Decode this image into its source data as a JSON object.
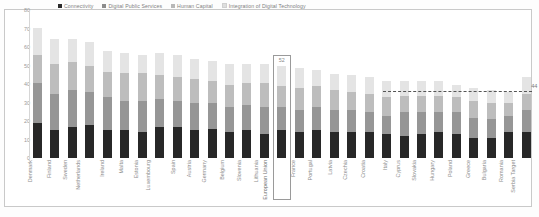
{
  "chart_data": {
    "type": "bar",
    "stacked": true,
    "title": "",
    "xlabel": "",
    "ylabel": "",
    "ylim": [
      0,
      80
    ],
    "yticks": [
      "80",
      "70",
      "60",
      "50",
      "40",
      "30",
      "20",
      "10",
      "0"
    ],
    "grid": false,
    "legend_position": "top",
    "series": [
      {
        "name": "Connectivity",
        "color": "#272727",
        "values": [
          19,
          15,
          17,
          18,
          15,
          15,
          14,
          17,
          17,
          15,
          16,
          14,
          15,
          13,
          15,
          14,
          15,
          14,
          14,
          14,
          13,
          12,
          13,
          14,
          13,
          11,
          11,
          14,
          14
        ]
      },
      {
        "name": "Human Capital",
        "color": "#969696",
        "values": [
          22,
          20,
          20,
          18,
          18,
          16,
          17,
          15,
          14,
          15,
          14,
          14,
          14,
          15,
          13,
          12,
          13,
          12,
          12,
          11,
          10,
          13,
          12,
          11,
          12,
          11,
          10,
          9,
          12
        ]
      },
      {
        "name": "Digital Public Services",
        "color": "#bdbdbd",
        "values": [
          15,
          16,
          15,
          14,
          14,
          15,
          15,
          13,
          13,
          13,
          12,
          12,
          12,
          13,
          11,
          12,
          11,
          11,
          10,
          10,
          10,
          9,
          9,
          9,
          8,
          9,
          9,
          7,
          9
        ]
      },
      {
        "name": "Integration of Digital Technology",
        "color": "#e4e4e4",
        "values": [
          15,
          14,
          13,
          13,
          11,
          11,
          10,
          12,
          12,
          11,
          11,
          11,
          10,
          10,
          11,
          11,
          9,
          9,
          9,
          9,
          9,
          8,
          8,
          8,
          7,
          7,
          7,
          6,
          9
        ]
      }
    ],
    "categories": [
      "Denmark",
      "Finland",
      "Sweden",
      "Netherlands",
      "Ireland",
      "Malta",
      "Estonia",
      "Luxembourg",
      "Spain",
      "Austria",
      "Germany",
      "Belgium",
      "Slovenia",
      "Lithuania",
      "European Union",
      "France",
      "Portugal",
      "Latvia",
      "Czechia",
      "Croatia",
      "Italy",
      "Cyprus",
      "Slovakia",
      "Hungary",
      "Poland",
      "Greece",
      "Bulgaria",
      "Romania",
      "Serbia Target"
    ],
    "highlighted_category": "European Union",
    "highlighted_value": "52",
    "annotations": [
      {
        "name": "target-line",
        "label": "44",
        "value": 44,
        "style": "dashed",
        "from_category": "Italy",
        "to_category": "Serbia Target"
      }
    ]
  },
  "legend": {
    "items": [
      {
        "label": "Connectivity",
        "swatch": "square-dark"
      },
      {
        "label": "Digital Public Services",
        "swatch": "square-mid"
      },
      {
        "label": "Human Capital",
        "swatch": "square-light"
      },
      {
        "label": "Integration of Digital Technology",
        "swatch": "square-lightest"
      }
    ]
  },
  "colors": {
    "connectivity": "#272727",
    "human_capital": "#969696",
    "digital_public_services": "#bdbdbd",
    "integration_digital_technology": "#e4e4e4",
    "axis": "#d6d6d6",
    "text": "#8d8d8d"
  }
}
